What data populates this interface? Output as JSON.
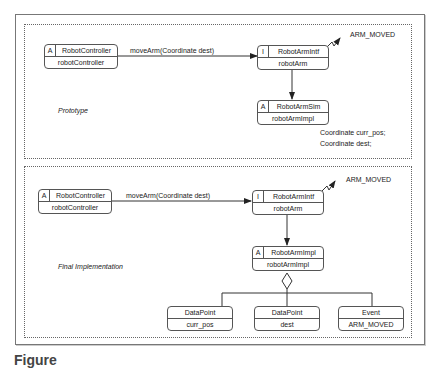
{
  "top_panel": {
    "label": "Prototype",
    "controller": {
      "tag": "A",
      "name": "RobotController",
      "instance": "robotController"
    },
    "message": "moveArm(Coordinate dest)",
    "interface": {
      "tag": "I",
      "name": "RobotArmIntf",
      "instance": "robotArm"
    },
    "event": "ARM_MOVED",
    "impl": {
      "tag": "A",
      "name": "RobotArmSim",
      "instance": "robotArmImpl"
    },
    "attributes": [
      "Coordinate curr_pos;",
      "Coordinate dest;"
    ]
  },
  "bottom_panel": {
    "label": "Final Implementation",
    "controller": {
      "tag": "A",
      "name": "RobotController",
      "instance": "robotController"
    },
    "message": "moveArm(Coordinate dest)",
    "interface": {
      "tag": "I",
      "name": "RobotArmIntf",
      "instance": "robotArm"
    },
    "event": "ARM_MOVED",
    "impl": {
      "tag": "A",
      "name": "RobotArmImpl",
      "instance": "robotArmImpl"
    },
    "parts": [
      {
        "name": "DataPoint",
        "instance": "curr_pos"
      },
      {
        "name": "DataPoint",
        "instance": "dest"
      },
      {
        "name": "Event",
        "instance": "ARM_MOVED"
      }
    ]
  },
  "caption": "Figure"
}
